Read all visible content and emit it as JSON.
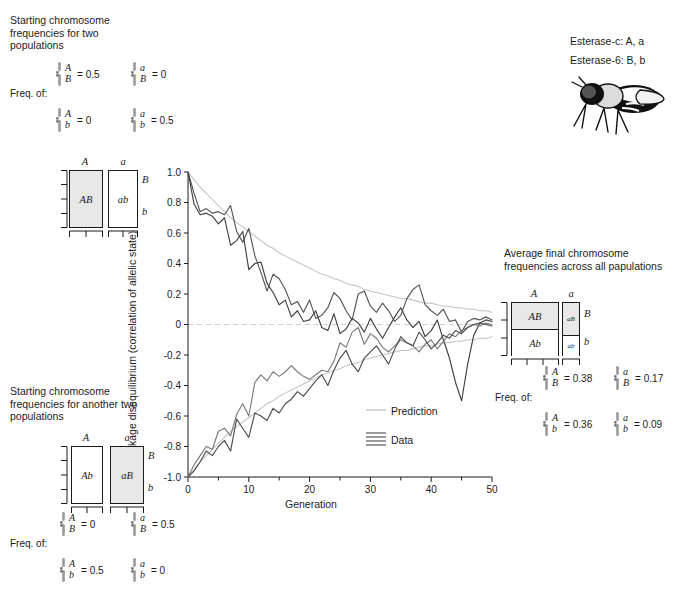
{
  "panels": {
    "top_left": {
      "caption": "Starting chromosome frequencies for two populations",
      "freq_label": "Freq. of:",
      "entries": [
        {
          "top": "A",
          "bottom": "B",
          "value": "= 0.5"
        },
        {
          "top": "a",
          "bottom": "B",
          "value": "= 0"
        },
        {
          "top": "A",
          "bottom": "b",
          "value": "= 0"
        },
        {
          "top": "a",
          "bottom": "b",
          "value": "= 0.5"
        }
      ],
      "diagram": {
        "col_headers": [
          "A",
          "a"
        ],
        "row_labels": [
          "B",
          "b"
        ],
        "cells": [
          {
            "label": "AB",
            "shaded": true
          },
          {
            "label": "ab",
            "shaded": false
          }
        ]
      }
    },
    "bottom_left": {
      "caption": "Starting chromosome frequencies for another two populations",
      "freq_label": "Freq. of:",
      "entries": [
        {
          "top": "A",
          "bottom": "B",
          "value": "= 0"
        },
        {
          "top": "a",
          "bottom": "B",
          "value": "= 0.5"
        },
        {
          "top": "A",
          "bottom": "b",
          "value": "= 0.5"
        },
        {
          "top": "a",
          "bottom": "b",
          "value": "= 0"
        }
      ],
      "diagram": {
        "col_headers": [
          "A",
          "a"
        ],
        "row_labels": [
          "B",
          "b"
        ],
        "cells": [
          {
            "label": "Ab",
            "shaded": false
          },
          {
            "label": "aB",
            "shaded": true
          }
        ]
      }
    },
    "right": {
      "caption": "Average final chromosome frequencies across all papulations",
      "freq_label": "Freq. of:",
      "entries": [
        {
          "top": "A",
          "bottom": "B",
          "value": "= 0.38"
        },
        {
          "top": "a",
          "bottom": "B",
          "value": "= 0.17"
        },
        {
          "top": "A",
          "bottom": "b",
          "value": "= 0.36"
        },
        {
          "top": "a",
          "bottom": "b",
          "value": "= 0.09"
        }
      ],
      "diagram": {
        "col_headers": [
          "A",
          "a"
        ],
        "row_labels": [
          "B",
          "b"
        ],
        "cells": [
          {
            "label": "AB",
            "shaded": true
          },
          {
            "label": "Ab",
            "shaded": false
          },
          {
            "label": "aB",
            "shaded": true
          },
          {
            "label": "ab",
            "shaded": false
          }
        ]
      }
    },
    "genes": {
      "line1": "Esterase-c: A, a",
      "line2": "Esterase-6: B, b",
      "organism": "drosophila-fly"
    }
  },
  "chart_data": {
    "type": "line",
    "title": "",
    "xlabel": "Generation",
    "ylabel": "Linkage disequilibrium (correlation of allelic state)",
    "xlim": [
      0,
      50
    ],
    "ylim": [
      -1.0,
      1.0
    ],
    "xticks": [
      0,
      10,
      20,
      30,
      40,
      50
    ],
    "xminor_step": 5,
    "yticks": [
      1.0,
      0.8,
      0.6,
      0.4,
      0.2,
      0,
      -0.2,
      -0.4,
      -0.6,
      -0.8,
      -1.0
    ],
    "ytick_labels": [
      "1.0",
      "0.8",
      "0.6",
      "0.4",
      "0.2",
      "0",
      "-0.2",
      "-0.4",
      "-0.6",
      "-0.8",
      "-1.0"
    ],
    "grid": false,
    "zero_line": true,
    "legend": {
      "position": "inside-lower-right",
      "entries": [
        {
          "label": "Prediction",
          "style": "single-light-line",
          "color": "#b9b9b9"
        },
        {
          "label": "Data",
          "style": "multi-dark-lines",
          "color": "#4a4a4a"
        }
      ]
    },
    "x": [
      0,
      1,
      2,
      3,
      4,
      5,
      6,
      7,
      8,
      9,
      10,
      11,
      12,
      13,
      14,
      15,
      16,
      17,
      18,
      19,
      20,
      21,
      22,
      23,
      24,
      25,
      26,
      27,
      28,
      29,
      30,
      31,
      32,
      33,
      34,
      35,
      36,
      37,
      38,
      39,
      40,
      41,
      42,
      43,
      44,
      45,
      46,
      47,
      48,
      49,
      50
    ],
    "series": [
      {
        "name": "Prediction (positive)",
        "kind": "prediction",
        "color": "#c4c4c4",
        "values": [
          1.0,
          0.95,
          0.9,
          0.86,
          0.82,
          0.78,
          0.74,
          0.7,
          0.67,
          0.64,
          0.61,
          0.58,
          0.55,
          0.52,
          0.5,
          0.47,
          0.45,
          0.43,
          0.41,
          0.39,
          0.37,
          0.35,
          0.33,
          0.32,
          0.3,
          0.29,
          0.27,
          0.26,
          0.25,
          0.23,
          0.22,
          0.21,
          0.2,
          0.19,
          0.18,
          0.17,
          0.17,
          0.16,
          0.15,
          0.14,
          0.14,
          0.13,
          0.12,
          0.12,
          0.11,
          0.11,
          0.1,
          0.1,
          0.09,
          0.09,
          0.08
        ]
      },
      {
        "name": "Prediction (negative)",
        "kind": "prediction",
        "color": "#c4c4c4",
        "values": [
          -1.0,
          -0.95,
          -0.9,
          -0.86,
          -0.82,
          -0.78,
          -0.74,
          -0.7,
          -0.67,
          -0.64,
          -0.61,
          -0.58,
          -0.55,
          -0.52,
          -0.5,
          -0.47,
          -0.45,
          -0.43,
          -0.41,
          -0.39,
          -0.37,
          -0.35,
          -0.33,
          -0.32,
          -0.3,
          -0.29,
          -0.27,
          -0.26,
          -0.25,
          -0.23,
          -0.22,
          -0.21,
          -0.2,
          -0.19,
          -0.18,
          -0.17,
          -0.17,
          -0.16,
          -0.15,
          -0.14,
          -0.14,
          -0.13,
          -0.12,
          -0.12,
          -0.11,
          -0.11,
          -0.1,
          -0.1,
          -0.09,
          -0.09,
          -0.08
        ]
      },
      {
        "name": "Data population 1",
        "kind": "data",
        "color": "#555555",
        "values": [
          1.0,
          0.86,
          0.74,
          0.76,
          0.73,
          0.74,
          0.72,
          0.78,
          0.61,
          0.54,
          0.63,
          0.45,
          0.34,
          0.22,
          0.33,
          0.3,
          0.23,
          0.13,
          0.15,
          0.08,
          0.16,
          0.04,
          0.06,
          0.11,
          0.21,
          0.17,
          0.09,
          0.03,
          0.2,
          0.22,
          0.12,
          0.08,
          0.14,
          0.09,
          0.02,
          0.06,
          0.17,
          0.23,
          0.26,
          0.13,
          0.09,
          0.06,
          0.1,
          0.02,
          0.03,
          -0.05,
          0.02,
          0.04,
          0.03,
          0.05,
          0.03
        ]
      },
      {
        "name": "Data population 2",
        "kind": "data",
        "color": "#3f3f3f",
        "values": [
          1.0,
          0.79,
          0.72,
          0.73,
          0.71,
          0.66,
          0.7,
          0.52,
          0.55,
          0.61,
          0.36,
          0.4,
          0.41,
          0.27,
          0.21,
          0.13,
          0.16,
          0.05,
          0.09,
          0.02,
          0.03,
          0.09,
          -0.02,
          -0.04,
          0.07,
          -0.06,
          -0.03,
          0.04,
          0.01,
          -0.05,
          0.04,
          -0.03,
          -0.09,
          -0.02,
          0.05,
          0.11,
          0.03,
          -0.02,
          0.02,
          -0.08,
          -0.04,
          0.03,
          -0.1,
          -0.22,
          -0.38,
          -0.5,
          -0.26,
          -0.07,
          0.01,
          0.03,
          0.02
        ]
      },
      {
        "name": "Data population 3",
        "kind": "data",
        "color": "#7a7a7a",
        "values": [
          -1.0,
          -0.92,
          -0.86,
          -0.8,
          -0.82,
          -0.7,
          -0.68,
          -0.73,
          -0.59,
          -0.52,
          -0.6,
          -0.38,
          -0.33,
          -0.37,
          -0.31,
          -0.34,
          -0.31,
          -0.27,
          -0.31,
          -0.34,
          -0.36,
          -0.33,
          -0.3,
          -0.31,
          -0.24,
          -0.12,
          -0.15,
          -0.05,
          -0.02,
          -0.13,
          -0.06,
          -0.09,
          -0.15,
          -0.18,
          -0.14,
          -0.1,
          -0.12,
          -0.14,
          -0.18,
          -0.13,
          -0.1,
          -0.16,
          -0.11,
          -0.06,
          -0.08,
          -0.04,
          -0.02,
          0.0,
          -0.01,
          0.01,
          0.0
        ]
      },
      {
        "name": "Data population 4",
        "kind": "data",
        "color": "#4d4d4d",
        "values": [
          -1.0,
          -0.96,
          -0.9,
          -0.83,
          -0.86,
          -0.8,
          -0.76,
          -0.83,
          -0.62,
          -0.68,
          -0.74,
          -0.58,
          -0.6,
          -0.63,
          -0.55,
          -0.58,
          -0.52,
          -0.49,
          -0.44,
          -0.47,
          -0.42,
          -0.37,
          -0.33,
          -0.4,
          -0.3,
          -0.22,
          -0.17,
          -0.26,
          -0.31,
          -0.22,
          -0.18,
          -0.14,
          -0.2,
          -0.26,
          -0.16,
          -0.08,
          -0.12,
          -0.14,
          -0.05,
          -0.1,
          -0.16,
          -0.12,
          -0.07,
          -0.09,
          -0.04,
          -0.06,
          -0.02,
          0.0,
          0.01,
          0.0,
          -0.01
        ]
      }
    ]
  }
}
